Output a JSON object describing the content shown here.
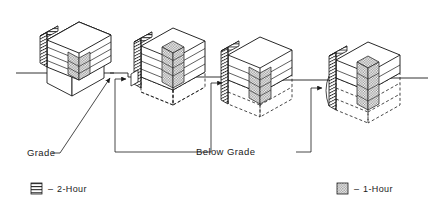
{
  "diagram": {
    "type": "isometric-technical-diagram",
    "background_color": "#ffffff",
    "line_color": "#1b1b1b"
  },
  "annotations": {
    "grade_label": "Grade",
    "below_grade_label": "Below Grade"
  },
  "legend": {
    "items": [
      {
        "id": "two-hour",
        "pattern": "horizontal-hatch",
        "dash": "–",
        "label": "2-Hour",
        "color": "#3a3a3a"
      },
      {
        "id": "one-hour",
        "pattern": "stipple-checker",
        "dash": "–",
        "label": "1-Hour",
        "color": "#9a9a9a"
      }
    ]
  },
  "buildings": [
    {
      "id": "building-1",
      "index": 1,
      "floors_above_grade": 4,
      "floors_below_grade": 0,
      "shaft_rating": "2-Hour",
      "column_rating": "1-Hour",
      "has_below_grade": false
    },
    {
      "id": "building-2",
      "index": 2,
      "floors_above_grade": 4,
      "floors_below_grade": 1,
      "shaft_rating": "2-Hour",
      "column_rating": "1-Hour",
      "has_below_grade": true
    },
    {
      "id": "building-3",
      "index": 3,
      "floors_above_grade": 3,
      "floors_below_grade": 2,
      "shaft_rating": "2-Hour",
      "column_rating": "1-Hour",
      "has_below_grade": true
    },
    {
      "id": "building-4",
      "index": 4,
      "floors_above_grade": 2,
      "floors_below_grade": 3,
      "shaft_rating": "2-Hour",
      "column_rating": "1-Hour",
      "has_below_grade": true
    }
  ]
}
